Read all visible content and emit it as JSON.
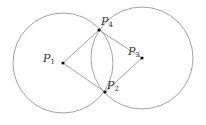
{
  "diagram": {
    "colors": {
      "stroke": "#8a8a8a",
      "point": "#111111",
      "text": "#333333"
    },
    "circles": [
      {
        "name": "circle-left",
        "cx": 63,
        "cy": 63,
        "r": 50
      },
      {
        "name": "circle-right",
        "cx": 142,
        "cy": 58,
        "r": 51
      }
    ],
    "points": [
      {
        "id": "P1",
        "base": "P",
        "sub": "1",
        "x": 63,
        "y": 63,
        "label_x": 43,
        "label_y": 53
      },
      {
        "id": "P4",
        "base": "P",
        "sub": "4",
        "x": 99,
        "y": 30,
        "label_x": 101,
        "label_y": 16
      },
      {
        "id": "P3",
        "base": "P",
        "sub": "3",
        "x": 142,
        "y": 58,
        "label_x": 128,
        "label_y": 46
      },
      {
        "id": "P2",
        "base": "P",
        "sub": "2",
        "x": 105,
        "y": 92,
        "label_x": 107,
        "label_y": 80
      }
    ],
    "segments": [
      [
        "P1",
        "P4"
      ],
      [
        "P4",
        "P3"
      ],
      [
        "P3",
        "P2"
      ],
      [
        "P2",
        "P1"
      ]
    ]
  }
}
